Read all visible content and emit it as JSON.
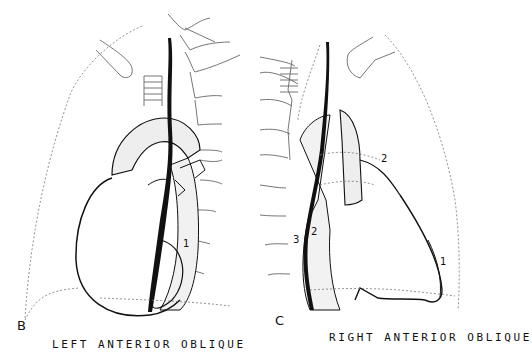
{
  "figure": {
    "panels": [
      {
        "id": "B",
        "letter": "B",
        "view_title": "LEFT ANTERIOR OBLIQUE",
        "labels": [
          "1"
        ]
      },
      {
        "id": "C",
        "letter": "C",
        "view_title": "RIGHT ANTERIOR OBLIQUE",
        "labels": [
          "1",
          "2",
          "2",
          "3"
        ]
      }
    ],
    "colors": {
      "ink": "#111111",
      "faint_line": "#888888",
      "background": "#ffffff"
    }
  }
}
